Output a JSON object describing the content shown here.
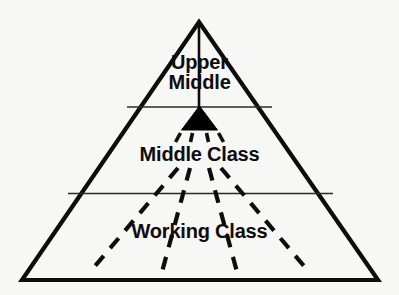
{
  "diagram": {
    "type": "social-class-pyramid",
    "background_color": "#f7f7f6",
    "stroke_color": "#0d0d0d",
    "divider_color": "#2a2a2a",
    "fill_color": "#000000",
    "labels": {
      "upper_middle_line1": "Upper",
      "upper_middle_line2": "Middle",
      "middle_class": "Middle Class",
      "working_class": "Working Class"
    },
    "tiers": [
      {
        "name": "Upper Middle",
        "position": "top"
      },
      {
        "name": "Middle Class",
        "position": "center"
      },
      {
        "name": "Working Class",
        "position": "bottom"
      }
    ],
    "shapes": {
      "outer_triangle": {
        "apex_x": 199,
        "apex_y": 22,
        "left_x": 22,
        "right_x": 378,
        "base_y": 280
      },
      "apex_stem": {
        "x": 199,
        "y_top": 24,
        "y_bottom": 108
      },
      "solid_marker_triangle": {
        "left_x": 182,
        "right_x": 217,
        "top_y": 107,
        "base_y": 130
      },
      "divider_upper": {
        "x1": 127,
        "x2": 272,
        "y": 107
      },
      "divider_lower": {
        "x1": 68,
        "x2": 333,
        "y": 193
      }
    }
  }
}
